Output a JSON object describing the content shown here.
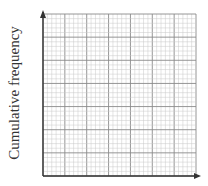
{
  "chart_data": {
    "type": "line",
    "title": "",
    "xlabel": "",
    "ylabel": "Cumulative frequency",
    "series": [],
    "grid": true,
    "grid_major_divisions": {
      "x": 7,
      "y": 7
    },
    "grid_minor_per_major": 5,
    "legend": null
  },
  "axes": {
    "y_label": "Cumulative frequency"
  },
  "colors": {
    "minor_grid": "#c8c8c8",
    "major_grid": "#8a8a8a",
    "axis": "#333333"
  }
}
